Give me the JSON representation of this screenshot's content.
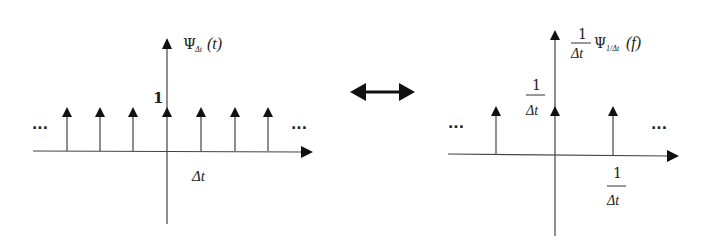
{
  "diagram": {
    "type": "fourier-transform-pair",
    "colors": {
      "stroke": "#333333",
      "background": "#ffffff"
    },
    "left_plot": {
      "y_axis_label_symbol": "Ψ",
      "y_axis_label_subscript": "Δt",
      "y_axis_label_arg": "(t)",
      "impulse_height_label": "1",
      "spacing_label": "Δt",
      "ellipsis_left": "···",
      "ellipsis_right": "···",
      "impulse_count_visible": 7
    },
    "relation_arrow": {
      "icon": "double-headed-arrow"
    },
    "right_plot": {
      "y_axis_label_coef_num": "1",
      "y_axis_label_coef_den": "Δt",
      "y_axis_label_symbol": "Ψ",
      "y_axis_label_subscript": "1/Δt",
      "y_axis_label_arg": "(f)",
      "impulse_height_label_num": "1",
      "impulse_height_label_den": "Δt",
      "spacing_label_num": "1",
      "spacing_label_den": "Δt",
      "ellipsis_left": "···",
      "ellipsis_right": "···",
      "impulse_count_visible": 3
    }
  }
}
